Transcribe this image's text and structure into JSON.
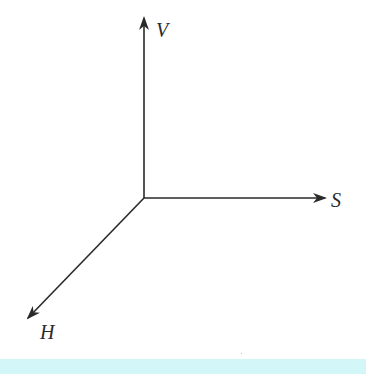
{
  "diagram": {
    "type": "3d-coordinate-axes",
    "origin": {
      "x": 144,
      "y": 198
    },
    "axes": [
      {
        "id": "V",
        "label": "V",
        "direction": "up",
        "tip": {
          "x": 144,
          "y": 18
        }
      },
      {
        "id": "S",
        "label": "S",
        "direction": "right",
        "tip": {
          "x": 325,
          "y": 198
        }
      },
      {
        "id": "H",
        "label": "H",
        "direction": "down-left",
        "tip": {
          "x": 28,
          "y": 318
        }
      }
    ],
    "line_color": "#2a2a2a",
    "band_color": "#d3f6f9"
  },
  "labels": {
    "v": "V",
    "s": "S",
    "h": "H"
  }
}
